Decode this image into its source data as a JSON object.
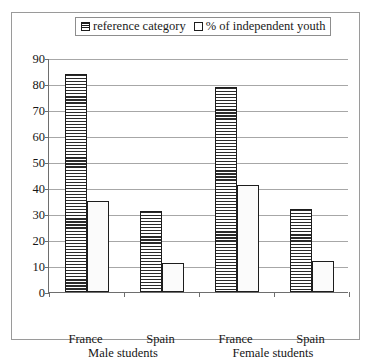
{
  "legend": {
    "items": [
      {
        "label": "reference category",
        "pattern": "horizontal-hatch",
        "icon": "legend-swatch-hatch-icon"
      },
      {
        "label": "% of independent youth",
        "pattern": "dotted",
        "icon": "legend-swatch-dot-icon"
      }
    ]
  },
  "chart_data": {
    "type": "bar",
    "title": "",
    "subtitle": "",
    "xlabel": "",
    "ylabel": "",
    "ylim": [
      0,
      90
    ],
    "yticks": [
      0,
      10,
      20,
      30,
      40,
      50,
      60,
      70,
      80,
      90
    ],
    "ytick_labels": [
      "0",
      "10",
      "20",
      "30",
      "40",
      "50",
      "60",
      "70",
      "80",
      "90"
    ],
    "grid": true,
    "legend_position": "top-center",
    "categories": [
      "France",
      "Spain",
      "France",
      "Spain"
    ],
    "group_labels": [
      "Male students",
      "Female students"
    ],
    "groups": [
      {
        "name": "Male students",
        "categories": [
          "France",
          "Spain"
        ]
      },
      {
        "name": "Female students",
        "categories": [
          "France",
          "Spain"
        ]
      }
    ],
    "series": [
      {
        "name": "reference category",
        "pattern": "horizontal-hatch",
        "values": [
          84,
          31,
          79,
          32
        ]
      },
      {
        "name": "% of independent youth",
        "pattern": "dotted",
        "values": [
          35,
          11,
          41,
          12
        ]
      }
    ]
  }
}
